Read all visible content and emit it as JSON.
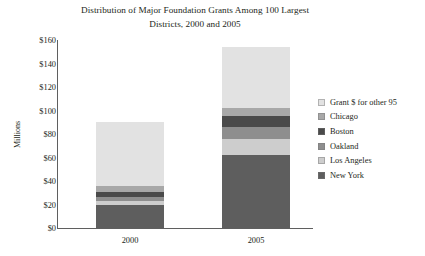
{
  "chart_data": {
    "type": "bar",
    "subtype": "stacked-vertical",
    "title": "Distribution of Major Foundation Grants Among 100 Largest Districts, 2000 and 2005",
    "title_line1": "Distribution of Major Foundation Grants Among 100 Largest",
    "title_line2": "Districts, 2000 and 2005",
    "xlabel": "",
    "ylabel": "Millions",
    "categories": [
      "2000",
      "2005"
    ],
    "ylim": [
      0,
      160
    ],
    "yticks": [
      {
        "value": 160,
        "label": "$160"
      },
      {
        "value": 140,
        "label": "$140"
      },
      {
        "value": 120,
        "label": "$120"
      },
      {
        "value": 100,
        "label": "$100"
      },
      {
        "value": 80,
        "label": "$80"
      },
      {
        "value": 60,
        "label": "$60"
      },
      {
        "value": 40,
        "label": "$40"
      },
      {
        "value": 20,
        "label": "$20"
      },
      {
        "value": 0,
        "label": "$0"
      }
    ],
    "grid": false,
    "legend_position": "right",
    "stack_order_bottom_to_top": [
      "New York",
      "Los Angeles",
      "Oakland",
      "Boston",
      "Chicago",
      "Grant $ for other 95"
    ],
    "series": [
      {
        "name": "Grant $ for other 95",
        "color": "#e2e2e2",
        "values": [
          54.5,
          51.5
        ]
      },
      {
        "name": "Chicago",
        "color": "#a8a8a8",
        "values": [
          5.0,
          7.0
        ]
      },
      {
        "name": "Boston",
        "color": "#4a4a4a",
        "values": [
          4.0,
          9.5
        ]
      },
      {
        "name": "Oakland",
        "color": "#8e8e8e",
        "values": [
          3.5,
          10.0
        ]
      },
      {
        "name": "Los Angeles",
        "color": "#cdcdcd",
        "values": [
          3.5,
          14.0
        ]
      },
      {
        "name": "New York",
        "color": "#5e5e5e",
        "values": [
          19.5,
          62.0
        ]
      }
    ],
    "totals": [
      90,
      154
    ]
  },
  "legend": {
    "items": [
      {
        "label": "Grant $ for other 95",
        "color": "#e2e2e2"
      },
      {
        "label": "Chicago",
        "color": "#a8a8a8"
      },
      {
        "label": "Boston",
        "color": "#4a4a4a"
      },
      {
        "label": "Oakland",
        "color": "#8e8e8e"
      },
      {
        "label": "Los Angeles",
        "color": "#cdcdcd"
      },
      {
        "label": "New York",
        "color": "#5e5e5e"
      }
    ]
  },
  "colors": {
    "axis": "#5f5f5f",
    "text": "#231f20",
    "background": "#ffffff"
  }
}
